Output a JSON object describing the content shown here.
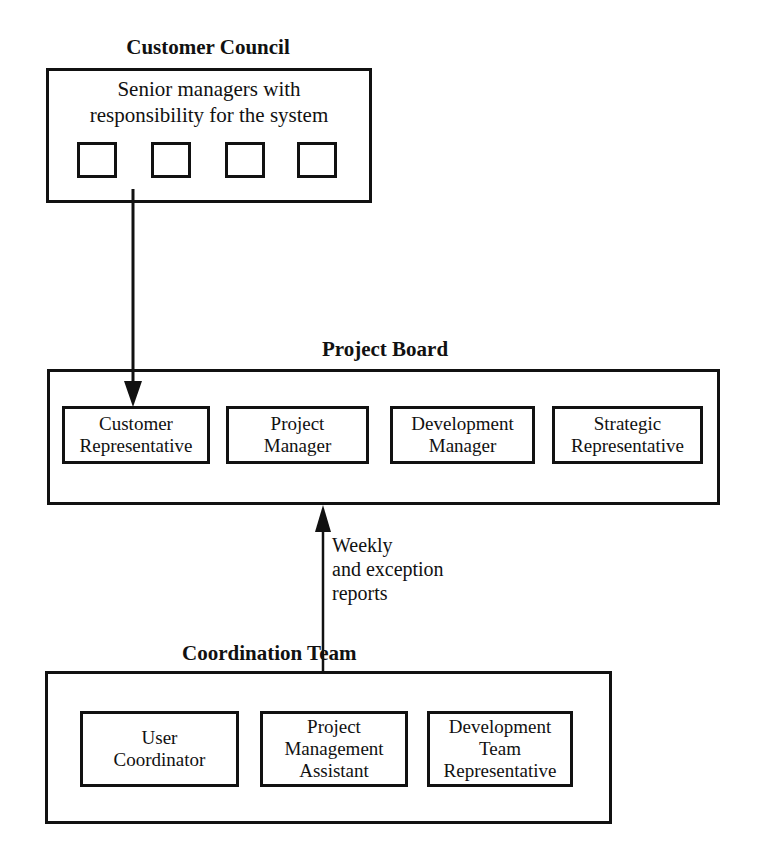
{
  "diagram": {
    "customer_council": {
      "title": "Customer Council",
      "description_lines": [
        "Senior managers with",
        "responsibility for the system"
      ],
      "member_slots": 4
    },
    "project_board": {
      "title": "Project Board",
      "roles": [
        {
          "lines": [
            "Customer",
            "Representative"
          ]
        },
        {
          "lines": [
            "Project",
            "Manager"
          ]
        },
        {
          "lines": [
            "Development",
            "Manager"
          ]
        },
        {
          "lines": [
            "Strategic",
            "Representative"
          ]
        }
      ]
    },
    "coordination_team": {
      "title": "Coordination Team",
      "roles": [
        {
          "lines": [
            "User",
            "Coordinator"
          ]
        },
        {
          "lines": [
            "Project",
            "Management",
            "Assistant"
          ]
        },
        {
          "lines": [
            "Development",
            "Team",
            "Representative"
          ]
        }
      ]
    },
    "connections": [
      {
        "from": "customer_council",
        "to": "project_board.customer_representative",
        "direction": "down",
        "label": ""
      },
      {
        "from": "coordination_team",
        "to": "project_board",
        "direction": "up",
        "label_lines": [
          "Weekly",
          "and exception",
          "reports"
        ]
      }
    ]
  },
  "colors": {
    "line": "#111111",
    "background": "#ffffff"
  }
}
